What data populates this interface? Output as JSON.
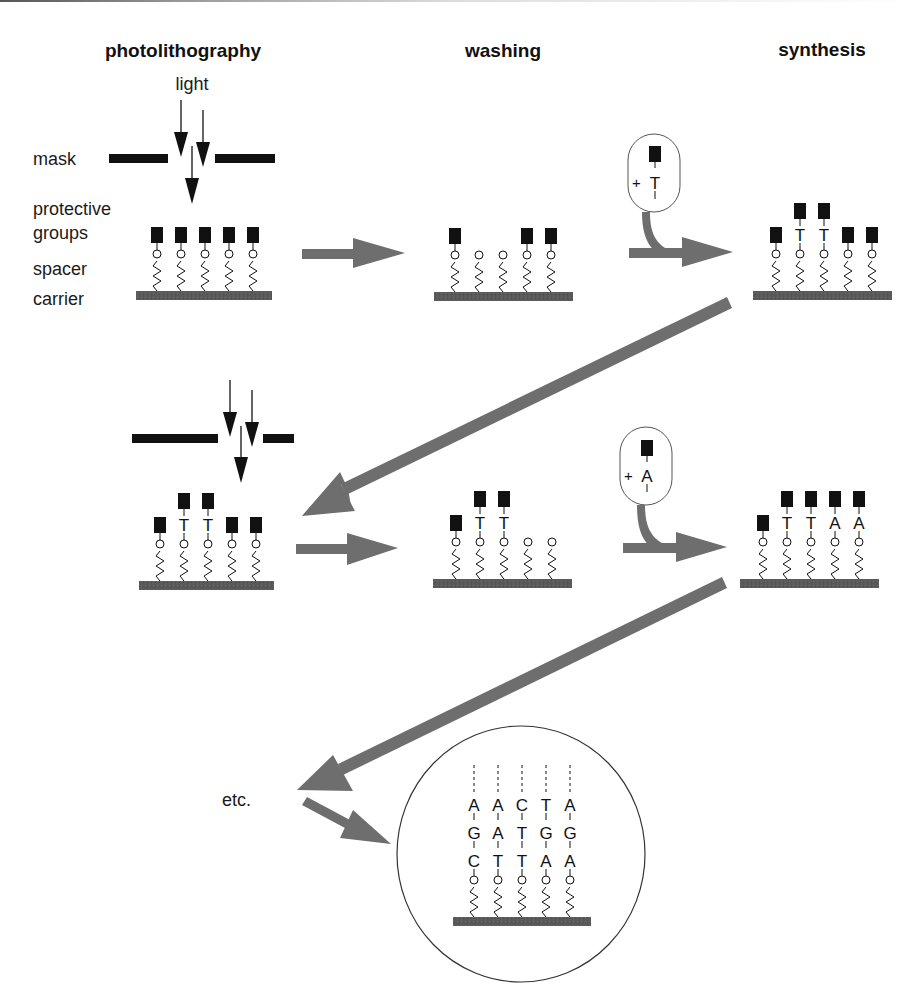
{
  "headers": {
    "photolithography": "photolithography",
    "washing": "washing",
    "synthesis": "synthesis"
  },
  "labels": {
    "light": "light",
    "mask": "mask",
    "protective_groups_1": "protective",
    "protective_groups_2": "groups",
    "spacer": "spacer",
    "carrier": "carrier",
    "etc": "etc."
  },
  "reagents": {
    "step1": {
      "plus": "+",
      "base": "T"
    },
    "step2": {
      "plus": "+",
      "base": "A"
    }
  },
  "colors": {
    "arrow": "#707070",
    "carrier": "#555555",
    "ink": "#111111"
  },
  "panels": {
    "row1_photolithography": {
      "strands": [
        [
          "P"
        ],
        [
          "P"
        ],
        [
          "P"
        ],
        [
          "P"
        ],
        [
          "P"
        ]
      ]
    },
    "row1_washing": {
      "strands": [
        [
          "P"
        ],
        [],
        [],
        [
          "P"
        ],
        [
          "P"
        ]
      ]
    },
    "row1_synthesis": {
      "strands": [
        [
          "P"
        ],
        [
          "T",
          "P"
        ],
        [
          "T",
          "P"
        ],
        [
          "P"
        ],
        [
          "P"
        ]
      ]
    },
    "row2_photolithography": {
      "strands": [
        [
          "P"
        ],
        [
          "T",
          "P"
        ],
        [
          "T",
          "P"
        ],
        [
          "P"
        ],
        [
          "P"
        ]
      ]
    },
    "row2_washing": {
      "strands": [
        [
          "P"
        ],
        [
          "T",
          "P"
        ],
        [
          "T",
          "P"
        ],
        [],
        []
      ]
    },
    "row2_synthesis": {
      "strands": [
        [
          "P"
        ],
        [
          "T",
          "P"
        ],
        [
          "T",
          "P"
        ],
        [
          "A",
          "P"
        ],
        [
          "A",
          "P"
        ]
      ]
    },
    "final": {
      "strands": [
        [
          "C",
          "G",
          "A"
        ],
        [
          "T",
          "A",
          "A"
        ],
        [
          "T",
          "T",
          "C"
        ],
        [
          "A",
          "G",
          "T"
        ],
        [
          "A",
          "G",
          "A"
        ]
      ]
    }
  }
}
